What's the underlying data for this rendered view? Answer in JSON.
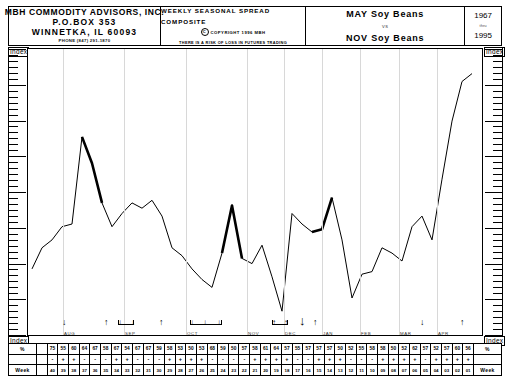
{
  "header": {
    "firm": {
      "line1": "MBH COMMODITY ADVISORS, INC.",
      "line2": "P.O.BOX 353",
      "line3": "WINNETKA, IL  60093",
      "phone": "PHONE (847) 291-1870"
    },
    "middle": {
      "title": "WEEKLY SEASONAL SPREAD COMPOSITE",
      "copyright_mark": "C",
      "copyright": "COPYRIGHT 1996 MBH",
      "disclaimer": "THERE IS A RISK OF LOSS IN FUTURES TRADING"
    },
    "spread": {
      "leg1": "MAY Soy Beans",
      "vs": "vs",
      "leg2": "NOV Soy Beans"
    },
    "years": {
      "from": "1967",
      "thru": "thru",
      "to": "1995"
    }
  },
  "axis": {
    "index_label": "Index",
    "row_pct_label": "%",
    "row_week_label": "Week"
  },
  "chart_data": {
    "type": "line",
    "subtitle": "1967 thru 1995",
    "xlabel": "Week",
    "ylabel": "Index",
    "ylim": [
      0,
      100
    ],
    "grid": "vertical-month-lines",
    "legend": "none",
    "months": [
      "AUG",
      "SEP",
      "OCT",
      "NOV",
      "DEC",
      "JAN",
      "FEB",
      "MAR",
      "APR"
    ],
    "month_x": [
      62,
      123,
      185,
      246,
      283,
      321,
      359,
      398,
      436
    ],
    "week_labels": [
      "40",
      "39",
      "38",
      "37",
      "36",
      "35",
      "34",
      "33",
      "32",
      "31",
      "30",
      "29",
      "28",
      "27",
      "26",
      "25",
      "24",
      "23",
      "22",
      "21",
      "20",
      "19",
      "18",
      "17",
      "16",
      "15",
      "14",
      "13",
      "12",
      "11",
      "10",
      "09",
      "08",
      "07",
      "06",
      "05",
      "04",
      "03",
      "02",
      "01"
    ],
    "pct_values": [
      "",
      "75",
      "55",
      "60",
      "64",
      "67",
      "58",
      "67",
      "54",
      "67",
      "67",
      "59",
      "58",
      "53",
      "50",
      "53",
      "68",
      "59",
      "50",
      "57",
      "58",
      "61",
      "64",
      "57",
      "55",
      "57",
      "57",
      "57",
      "50",
      "52",
      "55",
      "58",
      "58",
      "50",
      "52",
      "62",
      "57",
      "52",
      "57",
      "60",
      "56"
    ],
    "sign_values": [
      "",
      "-",
      "+",
      "+",
      "-",
      "-",
      "-",
      "+",
      "+",
      "-",
      "-",
      "-",
      "+",
      "+",
      "+",
      "+",
      "-",
      "-",
      "-",
      "-",
      "+",
      "+",
      "+",
      "+",
      "-",
      "-",
      "+",
      "+",
      "+",
      "-",
      "-",
      "-",
      "+",
      "+",
      "+",
      "+",
      "-",
      "+",
      "+",
      "+",
      "+"
    ],
    "values": [
      22,
      30,
      33,
      38,
      39,
      72,
      62,
      47,
      38,
      43,
      47,
      45,
      48,
      42,
      30,
      27,
      22,
      18,
      15,
      28,
      46,
      26,
      24,
      31,
      19,
      6,
      43,
      39,
      36,
      37,
      49,
      33,
      11,
      20,
      21,
      30,
      28,
      25,
      38,
      42,
      33,
      56,
      78,
      93,
      96
    ],
    "heavy_segments": [
      [
        5,
        7
      ],
      [
        19,
        21
      ],
      [
        28,
        30
      ]
    ],
    "direction_markers": [
      {
        "x": 62,
        "dir": "down"
      },
      {
        "x": 104,
        "dir": "up"
      },
      {
        "x": 118,
        "dir": "bracket-down"
      },
      {
        "x": 159,
        "dir": "up"
      },
      {
        "x": 196,
        "dir": "bracket-down-triple"
      },
      {
        "x": 276,
        "dir": "bracket-up"
      },
      {
        "x": 302,
        "dir": "down-heavy"
      },
      {
        "x": 313,
        "dir": "up"
      },
      {
        "x": 420,
        "dir": "down"
      },
      {
        "x": 460,
        "dir": "up"
      }
    ]
  }
}
